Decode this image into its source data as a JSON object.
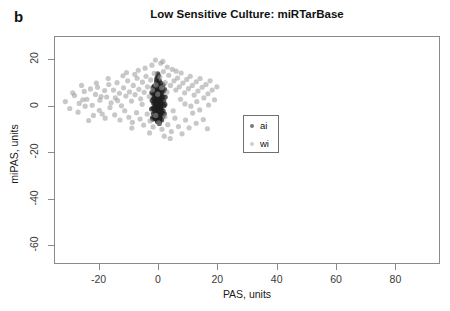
{
  "figure": {
    "panel_label": "b",
    "title": "Low Sensitive Culture: miRTarBase"
  },
  "chart_data": {
    "type": "scatter",
    "title": "Low Sensitive Culture: miRTarBase",
    "xlabel": "PAS, units",
    "ylabel": "miPAS, units",
    "xlim": [
      -35,
      95
    ],
    "ylim": [
      -68,
      30
    ],
    "xticks": [
      -20,
      0,
      20,
      40,
      60,
      80
    ],
    "xtick_labels": [
      "-20",
      "0",
      "20",
      "40",
      "60",
      "80"
    ],
    "yticks": [
      20,
      0,
      -20,
      -40,
      -60
    ],
    "ytick_labels": [
      "20",
      "0",
      "-20",
      "-40",
      "-60"
    ],
    "grid": false,
    "legend_position": "center-right-of-cluster",
    "series": [
      {
        "name": "ai",
        "color": "#1f1f1f",
        "marker": "circle",
        "points": [
          [
            -0.6,
            10.4
          ],
          [
            -0.2,
            9.1
          ],
          [
            0.1,
            8.2
          ],
          [
            -0.9,
            7.6
          ],
          [
            0.4,
            7.1
          ],
          [
            -0.4,
            6.5
          ],
          [
            0.2,
            6.1
          ],
          [
            -1.1,
            5.8
          ],
          [
            0.6,
            5.4
          ],
          [
            -0.3,
            5.0
          ],
          [
            0.0,
            4.6
          ],
          [
            -0.7,
            4.3
          ],
          [
            0.5,
            4.0
          ],
          [
            -0.2,
            3.7
          ],
          [
            0.3,
            3.4
          ],
          [
            -0.9,
            3.1
          ],
          [
            0.1,
            2.9
          ],
          [
            -0.5,
            2.6
          ],
          [
            0.7,
            2.4
          ],
          [
            -0.1,
            2.1
          ],
          [
            0.4,
            1.9
          ],
          [
            -0.8,
            1.7
          ],
          [
            0.2,
            1.4
          ],
          [
            -0.3,
            1.2
          ],
          [
            0.6,
            1.0
          ],
          [
            0.0,
            0.8
          ],
          [
            -0.6,
            0.6
          ],
          [
            0.3,
            0.4
          ],
          [
            -0.2,
            0.2
          ],
          [
            0.5,
            0.0
          ],
          [
            -1.0,
            -0.2
          ],
          [
            0.1,
            -0.4
          ],
          [
            -0.4,
            -0.7
          ],
          [
            0.7,
            -0.9
          ],
          [
            -0.1,
            -1.1
          ],
          [
            0.4,
            -1.4
          ],
          [
            -0.7,
            -1.6
          ],
          [
            0.2,
            -1.9
          ],
          [
            -0.3,
            -2.2
          ],
          [
            0.6,
            -2.5
          ],
          [
            0.0,
            -2.8
          ],
          [
            -0.8,
            -3.1
          ],
          [
            0.3,
            -3.4
          ],
          [
            -0.2,
            -3.8
          ],
          [
            0.5,
            -4.2
          ],
          [
            -0.5,
            -4.6
          ],
          [
            0.1,
            -5.0
          ],
          [
            -0.9,
            -5.4
          ],
          [
            0.4,
            -5.9
          ],
          [
            -0.2,
            -6.4
          ],
          [
            0.2,
            -6.9
          ],
          [
            -0.6,
            11.5
          ],
          [
            0.8,
            10.0
          ],
          [
            -1.3,
            8.8
          ],
          [
            1.0,
            7.9
          ],
          [
            -1.5,
            6.9
          ],
          [
            1.2,
            6.2
          ],
          [
            -1.2,
            5.2
          ],
          [
            0.9,
            4.5
          ],
          [
            -1.4,
            3.9
          ],
          [
            1.1,
            3.2
          ],
          [
            -1.0,
            2.7
          ],
          [
            0.8,
            2.0
          ],
          [
            -1.3,
            1.5
          ],
          [
            1.3,
            0.9
          ],
          [
            -1.1,
            0.3
          ],
          [
            0.9,
            -0.3
          ],
          [
            -1.4,
            -1.0
          ],
          [
            1.0,
            -1.7
          ],
          [
            -1.2,
            -2.4
          ],
          [
            1.2,
            -3.0
          ],
          [
            -0.9,
            -3.7
          ],
          [
            0.8,
            -4.4
          ],
          [
            -1.1,
            -5.2
          ],
          [
            1.1,
            -6.0
          ],
          [
            -0.4,
            12.4
          ],
          [
            0.3,
            11.1
          ],
          [
            -0.1,
            9.6
          ],
          [
            0.6,
            8.6
          ],
          [
            -0.7,
            7.4
          ],
          [
            0.2,
            6.7
          ],
          [
            -0.3,
            5.6
          ],
          [
            0.7,
            4.9
          ],
          [
            -0.5,
            4.1
          ],
          [
            0.1,
            3.5
          ],
          [
            -0.2,
            2.8
          ],
          [
            0.4,
            2.2
          ],
          [
            -0.6,
            1.6
          ],
          [
            0.5,
            1.1
          ],
          [
            -0.3,
            0.5
          ],
          [
            0.2,
            -0.1
          ],
          [
            -0.4,
            -0.8
          ],
          [
            0.6,
            -1.5
          ],
          [
            -0.1,
            -2.1
          ],
          [
            0.3,
            -2.9
          ],
          [
            -0.5,
            -3.6
          ],
          [
            0.4,
            -4.3
          ],
          [
            -0.2,
            -5.1
          ],
          [
            0.5,
            -5.8
          ],
          [
            -0.3,
            -6.6
          ],
          [
            1.6,
            9.3
          ],
          [
            -1.8,
            8.1
          ],
          [
            1.7,
            6.6
          ],
          [
            -1.9,
            5.5
          ],
          [
            1.5,
            4.2
          ],
          [
            -1.7,
            3.3
          ],
          [
            1.8,
            2.3
          ],
          [
            -1.6,
            1.3
          ],
          [
            1.9,
            0.2
          ],
          [
            -1.8,
            -0.9
          ],
          [
            1.6,
            -2.0
          ],
          [
            -1.7,
            -3.2
          ],
          [
            1.5,
            -4.5
          ],
          [
            -1.9,
            -5.6
          ],
          [
            2.1,
            7.2
          ],
          [
            -2.2,
            5.9
          ],
          [
            2.3,
            4.0
          ],
          [
            -2.1,
            2.5
          ],
          [
            2.2,
            0.8
          ],
          [
            -2.3,
            -1.2
          ],
          [
            2.0,
            -3.3
          ],
          [
            -2.0,
            -5.0
          ],
          [
            0.0,
            13.2
          ],
          [
            -0.2,
            14.0
          ],
          [
            0.3,
            -7.5
          ]
        ]
      },
      {
        "name": "wi",
        "color": "#9a9a9a",
        "marker": "circle",
        "points": [
          [
            -31.5,
            2.0
          ],
          [
            -28.4,
            4.6
          ],
          [
            -26.8,
            1.2
          ],
          [
            -25.1,
            6.4
          ],
          [
            -24.2,
            3.0
          ],
          [
            -23.0,
            7.5
          ],
          [
            -22.4,
            0.4
          ],
          [
            -21.3,
            5.1
          ],
          [
            -20.6,
            8.2
          ],
          [
            -19.8,
            2.6
          ],
          [
            -19.0,
            -3.4
          ],
          [
            -18.2,
            6.8
          ],
          [
            -17.5,
            4.0
          ],
          [
            -16.8,
            9.4
          ],
          [
            -16.0,
            1.5
          ],
          [
            -15.2,
            7.0
          ],
          [
            -14.6,
            3.6
          ],
          [
            -14.0,
            10.2
          ],
          [
            -13.2,
            5.6
          ],
          [
            -12.5,
            0.2
          ],
          [
            -11.8,
            8.0
          ],
          [
            -11.0,
            4.4
          ],
          [
            -10.4,
            11.0
          ],
          [
            -9.8,
            6.2
          ],
          [
            -9.1,
            2.2
          ],
          [
            -8.5,
            9.0
          ],
          [
            -7.9,
            5.0
          ],
          [
            -7.2,
            12.1
          ],
          [
            -6.6,
            7.3
          ],
          [
            -6.0,
            3.2
          ],
          [
            -5.4,
            10.4
          ],
          [
            -4.8,
            6.0
          ],
          [
            -4.2,
            13.0
          ],
          [
            -3.7,
            8.4
          ],
          [
            -3.1,
            4.2
          ],
          [
            -2.6,
            11.4
          ],
          [
            -2.0,
            7.0
          ],
          [
            -1.4,
            14.2
          ],
          [
            -0.8,
            9.2
          ],
          [
            -0.2,
            5.2
          ],
          [
            0.5,
            12.6
          ],
          [
            1.1,
            8.0
          ],
          [
            1.7,
            15.0
          ],
          [
            2.3,
            10.2
          ],
          [
            2.9,
            6.1
          ],
          [
            3.5,
            13.4
          ],
          [
            4.1,
            9.0
          ],
          [
            4.7,
            16.0
          ],
          [
            5.3,
            11.0
          ],
          [
            5.9,
            7.0
          ],
          [
            6.5,
            12.2
          ],
          [
            7.1,
            8.4
          ],
          [
            7.7,
            14.4
          ],
          [
            8.3,
            10.0
          ],
          [
            8.9,
            5.8
          ],
          [
            9.6,
            11.6
          ],
          [
            10.2,
            7.6
          ],
          [
            10.8,
            13.0
          ],
          [
            11.5,
            9.0
          ],
          [
            12.1,
            4.8
          ],
          [
            12.8,
            10.6
          ],
          [
            13.4,
            6.6
          ],
          [
            14.1,
            12.0
          ],
          [
            14.8,
            8.2
          ],
          [
            15.4,
            3.6
          ],
          [
            16.1,
            9.4
          ],
          [
            16.8,
            5.4
          ],
          [
            17.5,
            11.0
          ],
          [
            18.2,
            7.0
          ],
          [
            19.0,
            2.8
          ],
          [
            19.8,
            8.4
          ],
          [
            -30.0,
            -1.0
          ],
          [
            -27.2,
            -2.6
          ],
          [
            -24.8,
            0.0
          ],
          [
            -22.0,
            -4.0
          ],
          [
            -20.0,
            -1.8
          ],
          [
            -18.0,
            -5.2
          ],
          [
            -16.4,
            -0.6
          ],
          [
            -14.8,
            -3.8
          ],
          [
            -13.0,
            -6.0
          ],
          [
            -11.4,
            -2.0
          ],
          [
            -10.0,
            -4.8
          ],
          [
            -8.8,
            -7.0
          ],
          [
            -7.4,
            -2.8
          ],
          [
            -6.2,
            -5.6
          ],
          [
            -5.0,
            -8.2
          ],
          [
            -3.8,
            -3.4
          ],
          [
            -2.8,
            -6.4
          ],
          [
            -1.8,
            -9.0
          ],
          [
            -0.9,
            -4.0
          ],
          [
            0.1,
            -7.2
          ],
          [
            1.2,
            -10.0
          ],
          [
            2.2,
            -4.6
          ],
          [
            3.2,
            -8.0
          ],
          [
            4.4,
            -11.0
          ],
          [
            5.6,
            -5.2
          ],
          [
            6.8,
            -8.8
          ],
          [
            8.0,
            -12.0
          ],
          [
            9.2,
            -6.0
          ],
          [
            10.4,
            -9.4
          ],
          [
            11.6,
            -3.0
          ],
          [
            12.8,
            -7.4
          ],
          [
            14.0,
            -1.6
          ],
          [
            15.2,
            -5.8
          ],
          [
            16.6,
            -9.8
          ],
          [
            -29.0,
            5.8
          ],
          [
            -26.0,
            9.0
          ],
          [
            -23.6,
            -6.2
          ],
          [
            -21.0,
            10.0
          ],
          [
            -17.0,
            12.0
          ],
          [
            -12.0,
            13.2
          ],
          [
            -9.0,
            -9.5
          ],
          [
            -4.5,
            16.5
          ],
          [
            -2.2,
            17.8
          ],
          [
            0.8,
            18.6
          ],
          [
            3.0,
            17.0
          ],
          [
            6.0,
            15.2
          ],
          [
            -6.8,
            15.6
          ],
          [
            -8.0,
            13.8
          ],
          [
            -10.8,
            14.6
          ],
          [
            1.5,
            19.4
          ],
          [
            -1.0,
            20.0
          ],
          [
            4.0,
            -14.0
          ],
          [
            2.0,
            -13.0
          ],
          [
            -3.0,
            -11.6
          ],
          [
            7.5,
            3.0
          ],
          [
            9.0,
            1.0
          ],
          [
            11.0,
            0.0
          ],
          [
            13.0,
            2.0
          ],
          [
            17.0,
            0.5
          ],
          [
            5.0,
            -2.0
          ],
          [
            -5.5,
            0.8
          ],
          [
            -13.8,
            2.4
          ],
          [
            -19.4,
            4.2
          ],
          [
            -25.6,
            2.8
          ]
        ]
      }
    ]
  },
  "legend": {
    "entries": [
      {
        "label": "ai",
        "color": "#1f1f1f"
      },
      {
        "label": "wi",
        "color": "#9a9a9a"
      }
    ]
  }
}
